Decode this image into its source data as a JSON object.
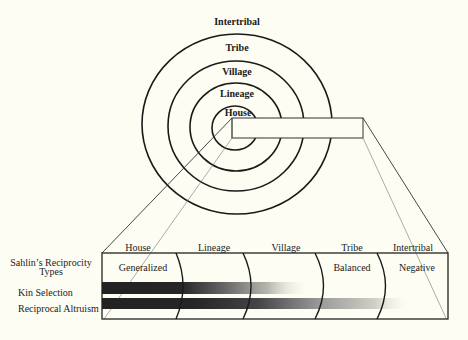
{
  "diagram": {
    "rings": [
      {
        "label": "House",
        "radius": 24
      },
      {
        "label": "Lineage",
        "radius": 46
      },
      {
        "label": "Village",
        "radius": 68
      },
      {
        "label": "Tribe",
        "radius": 92
      }
    ],
    "outer_label": "Intertribal",
    "ring_labels": {
      "intertribal": "Intertribal",
      "tribe": "Tribe",
      "village": "Village",
      "lineage": "Lineage",
      "house": "House"
    },
    "columns": [
      "House",
      "Lineage",
      "Village",
      "Tribe",
      "Intertribal"
    ],
    "row_labels": {
      "sahlins_line1": "Sahlin’s Reciprocity",
      "sahlins_line2": "Types",
      "kin_selection": "Kin Selection",
      "reciprocal_altruism": "Reciprocal Altruism"
    },
    "reciprocity_types": {
      "generalized": "Generalized",
      "balanced": "Balanced",
      "negative": "Negative"
    },
    "bars": [
      {
        "name": "Kin Selection",
        "extends_through": "Village"
      },
      {
        "name": "Reciprocal Altruism",
        "extends_through": "Tribe"
      }
    ],
    "colors": {
      "background": "#fdfdf3",
      "line": "#1a1a1a",
      "bar": "#2a2a2a"
    }
  }
}
